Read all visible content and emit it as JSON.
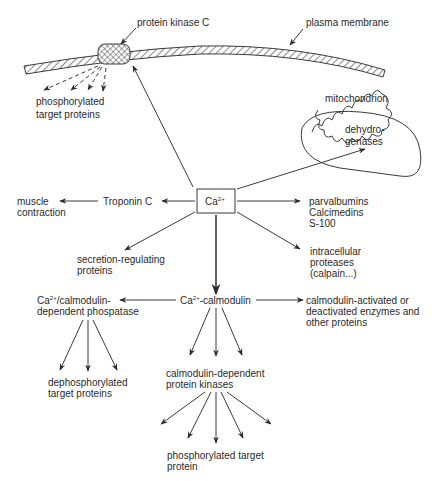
{
  "diagram": {
    "type": "calcium signaling pathway",
    "nodes": {
      "ca": {
        "label": "Ca",
        "sup": "2+"
      },
      "pkc": {
        "label": "protein kinase C"
      },
      "membrane": {
        "label": "plasma membrane"
      },
      "phos_target_top": {
        "lines": [
          "phosphorylated",
          "target proteins"
        ]
      },
      "mitochondrion": {
        "label": "mitochondrion"
      },
      "dehydrogenases": {
        "lines": [
          "dehydro-",
          "genases"
        ]
      },
      "muscle": {
        "lines": [
          "muscle",
          "contraction"
        ]
      },
      "troponin": {
        "label": "Troponin C"
      },
      "parvalbumins": {
        "lines": [
          "parvalbumins",
          "Calcimedins",
          "S-100"
        ]
      },
      "secretion": {
        "lines": [
          "secretion-regulating",
          "proteins"
        ]
      },
      "proteases": {
        "lines": [
          "intracellular",
          "proteases",
          "(calpain...)"
        ]
      },
      "phosphatase": {
        "line1_pre": "Ca",
        "line1_sup": "2+",
        "line1_post": "/calmodulin-",
        "line2": "dependent phospatase"
      },
      "calmodulin": {
        "pre": "Ca",
        "sup": "2+",
        "post": "-calmodulin"
      },
      "activated": {
        "lines": [
          "calmodulin-activated or",
          "deactivated enzymes and",
          "other proteins"
        ]
      },
      "dephos": {
        "lines": [
          "dephosphorylated",
          "target proteins"
        ]
      },
      "kinases": {
        "lines": [
          "calmodulin-dependent",
          "protein kinases"
        ]
      },
      "phos_target_bottom": {
        "lines": [
          "phosphorylated target",
          "protein"
        ]
      }
    },
    "edges": [
      {
        "from": "ca",
        "to": "pkc"
      },
      {
        "from": "pkc",
        "to": "phos_target_top",
        "style": "dashed",
        "count": 4
      },
      {
        "from": "ca",
        "to": "dehydrogenases"
      },
      {
        "from": "ca",
        "to": "troponin"
      },
      {
        "from": "troponin",
        "to": "muscle"
      },
      {
        "from": "ca",
        "to": "parvalbumins"
      },
      {
        "from": "ca",
        "to": "secretion"
      },
      {
        "from": "ca",
        "to": "proteases"
      },
      {
        "from": "ca",
        "to": "calmodulin",
        "style": "thick"
      },
      {
        "from": "calmodulin",
        "to": "phosphatase"
      },
      {
        "from": "calmodulin",
        "to": "activated"
      },
      {
        "from": "calmodulin",
        "to": "kinases",
        "count": 3
      },
      {
        "from": "phosphatase",
        "to": "dephos",
        "count": 3
      },
      {
        "from": "kinases",
        "to": "phos_target_bottom",
        "count": 5
      }
    ]
  }
}
